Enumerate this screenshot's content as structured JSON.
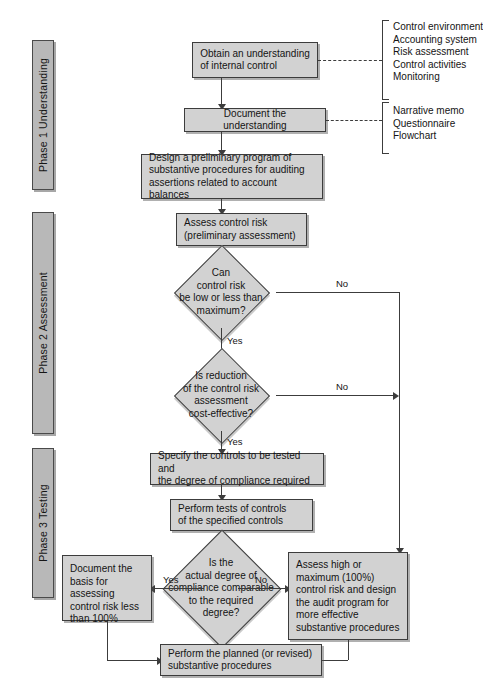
{
  "figure": {
    "accent_box_fill": "#d2d2d2",
    "phase_bar_fill": "#b8b8b8",
    "line_color": "#3c3c3c"
  },
  "phases": [
    {
      "id": "phase1",
      "label": "Phase 1 Understanding"
    },
    {
      "id": "phase2",
      "label": "Phase 2 Assessment"
    },
    {
      "id": "phase3",
      "label": "Phase 3 Testing"
    }
  ],
  "nodes": {
    "obtain_understanding": "Obtain an understanding\nof internal control",
    "document_understanding": "Document the understanding",
    "design_preliminary": "Design a preliminary program of\nsubstantive procedures for auditing\nassertions related to account balances",
    "assess_control_risk": "Assess control risk\n(preliminary assessment)",
    "specify_controls": "Specify the controls to be tested and\nthe degree of compliance required",
    "perform_tests": "Perform tests of controls\nof the specified controls",
    "document_basis": "Document the\nbasis for assessing\ncontrol risk less\nthan 100%",
    "assess_high": "Assess high or\nmaximum (100%)\ncontrol risk and design\nthe audit program for\nmore effective\nsubstantive procedures",
    "perform_planned": "Perform the planned (or revised)\nsubstantive procedures"
  },
  "decisions": {
    "d1": "Can\ncontrol risk\nbe low or less than\nmaximum?",
    "d2": "Is reduction\nof the control risk\nassessment\ncost-effective?",
    "d3": "Is the\nactual degree of\ncompliance comparable\nto the required\ndegree?"
  },
  "edge_labels": {
    "d1_no": "No",
    "d1_yes": "Yes",
    "d2_no": "No",
    "d2_yes": "Yes",
    "d3_yes": "Yes",
    "d3_no": "No"
  },
  "annotations": {
    "understanding_components": [
      "Control environment",
      "Accounting system",
      "Risk assessment",
      "Control activities",
      "Monitoring"
    ],
    "documentation_methods": [
      "Narrative memo",
      "Questionnaire",
      "Flowchart"
    ]
  }
}
